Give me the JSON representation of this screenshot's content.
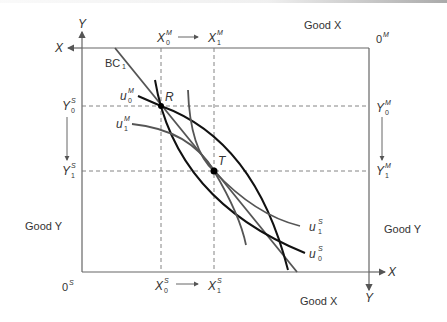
{
  "figure": {
    "type": "edgeworth-box",
    "axes": {
      "origin_s_label": "0",
      "origin_s_sup": "S",
      "origin_m_label": "0",
      "origin_m_sup": "M",
      "top_left_x_axis": "X",
      "top_left_y_axis": "Y",
      "bottom_right_x_axis": "X",
      "bottom_right_y_axis": "Y",
      "good_x_top": "Good X",
      "good_x_bottom": "Good X",
      "good_y_left": "Good Y",
      "good_y_right": "Good Y"
    },
    "top_ticks": {
      "x0": {
        "base": "X",
        "sup": "M",
        "sub": "0"
      },
      "x1": {
        "base": "X",
        "sup": "M",
        "sub": "1"
      }
    },
    "bottom_ticks": {
      "x0": {
        "base": "X",
        "sup": "S",
        "sub": "0"
      },
      "x1": {
        "base": "X",
        "sup": "S",
        "sub": "1"
      }
    },
    "left_ticks": {
      "y0": {
        "base": "Y",
        "sup": "S",
        "sub": "0"
      },
      "y1": {
        "base": "Y",
        "sup": "S",
        "sub": "1"
      }
    },
    "right_ticks": {
      "y0": {
        "base": "Y",
        "sup": "M",
        "sub": "0"
      },
      "y1": {
        "base": "Y",
        "sup": "M",
        "sub": "1"
      }
    },
    "budget_line": {
      "base": "BC",
      "sub": "1"
    },
    "curves": {
      "u0M": {
        "base": "u",
        "sup": "M",
        "sub": "0",
        "color": "#111111"
      },
      "u1M": {
        "base": "u",
        "sup": "M",
        "sub": "1",
        "color": "#555555"
      },
      "u0S": {
        "base": "u",
        "sup": "S",
        "sub": "0",
        "color": "#111111"
      },
      "u1S": {
        "base": "u",
        "sup": "S",
        "sub": "1",
        "color": "#555555"
      }
    },
    "points": {
      "R": "R",
      "T": "T"
    },
    "colors": {
      "axis": "#666666",
      "dashed": "#777777",
      "budget": "#555555",
      "point": "#000000"
    }
  }
}
